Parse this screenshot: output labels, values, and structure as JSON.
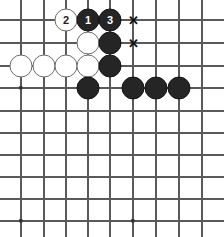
{
  "figure": {
    "kind": "go-board-diagram",
    "width": 224,
    "height": 237,
    "background_color": "#ffffff"
  },
  "board": {
    "line_color": "#5a5a5a",
    "star_point_color": "#333333",
    "column_x": [
      21,
      44,
      66,
      88,
      110,
      133,
      156,
      179,
      202
    ],
    "row_y": [
      20,
      43,
      66,
      88,
      111,
      133,
      155,
      177,
      199,
      221
    ],
    "star_points": [
      {
        "col": 0,
        "row": 3
      },
      {
        "col": 0,
        "row": 9
      },
      {
        "col": 5,
        "row": 9
      }
    ]
  },
  "stones": [
    {
      "id": "stone-w-2",
      "color": "white",
      "col": 2,
      "row": 0,
      "label": "2",
      "radius": 11.5
    },
    {
      "id": "stone-b-1",
      "color": "black",
      "col": 3,
      "row": 0,
      "label": "1",
      "radius": 11.5
    },
    {
      "id": "stone-b-3",
      "color": "black",
      "col": 4,
      "row": 0,
      "label": "3",
      "radius": 11.5
    },
    {
      "id": "stone-w-a",
      "color": "white",
      "col": 3,
      "row": 1,
      "label": "",
      "radius": 11.5
    },
    {
      "id": "stone-b-a",
      "color": "black",
      "col": 4,
      "row": 1,
      "label": "",
      "radius": 11.5
    },
    {
      "id": "stone-w-b",
      "color": "white",
      "col": 0,
      "row": 2,
      "label": "",
      "radius": 11.5
    },
    {
      "id": "stone-w-c",
      "color": "white",
      "col": 1,
      "row": 2,
      "label": "",
      "radius": 11.5
    },
    {
      "id": "stone-w-d",
      "color": "white",
      "col": 2,
      "row": 2,
      "label": "",
      "radius": 11.5
    },
    {
      "id": "stone-w-e",
      "color": "white",
      "col": 3,
      "row": 2,
      "label": "",
      "radius": 11.5
    },
    {
      "id": "stone-b-b",
      "color": "black",
      "col": 4,
      "row": 2,
      "label": "",
      "radius": 11.5
    },
    {
      "id": "stone-b-c",
      "color": "black",
      "col": 3,
      "row": 3,
      "label": "",
      "radius": 11.5
    },
    {
      "id": "stone-b-d",
      "color": "black",
      "col": 5,
      "row": 3,
      "label": "",
      "radius": 11.5
    },
    {
      "id": "stone-b-e",
      "color": "black",
      "col": 6,
      "row": 3,
      "label": "",
      "radius": 11.5
    },
    {
      "id": "stone-b-f",
      "color": "black",
      "col": 7,
      "row": 3,
      "label": "",
      "radius": 11.5
    }
  ],
  "marks": [
    {
      "id": "mark-x-top",
      "glyph": "✕",
      "col": 5,
      "row": 0,
      "size": 13,
      "color": "#111111"
    },
    {
      "id": "mark-x-second",
      "glyph": "✕",
      "col": 5,
      "row": 1,
      "size": 13,
      "color": "#111111"
    }
  ]
}
